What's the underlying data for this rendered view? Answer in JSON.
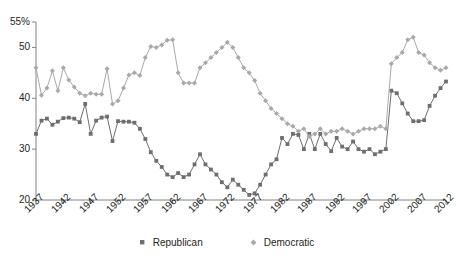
{
  "chart_data": {
    "type": "line",
    "title": "",
    "subtitle": "",
    "xlabel": "",
    "ylabel": "",
    "xlim": [
      1937,
      2012
    ],
    "ylim": [
      20,
      55
    ],
    "grid": false,
    "legend_position": "bottom-center",
    "y_ticks": [
      20,
      30,
      40,
      50,
      55
    ],
    "y_tick_labels": [
      "20",
      "30",
      "40",
      "50",
      "55%"
    ],
    "x_ticks": [
      1937,
      1942,
      1947,
      1952,
      1957,
      1962,
      1967,
      1972,
      1977,
      1982,
      1987,
      1992,
      1997,
      2002,
      2007,
      2012
    ],
    "x_tick_labels": [
      "1937",
      "1942",
      "1947",
      "1952",
      "1957",
      "1962",
      "1967",
      "1972",
      "1977",
      "1982",
      "1987",
      "1992",
      "1997",
      "2002",
      "2007",
      "2012"
    ],
    "x": [
      1937,
      1938,
      1939,
      1940,
      1941,
      1942,
      1943,
      1944,
      1945,
      1946,
      1947,
      1948,
      1949,
      1950,
      1951,
      1952,
      1953,
      1954,
      1955,
      1956,
      1957,
      1958,
      1959,
      1960,
      1961,
      1962,
      1963,
      1964,
      1965,
      1966,
      1967,
      1968,
      1969,
      1970,
      1971,
      1972,
      1973,
      1974,
      1975,
      1976,
      1977,
      1978,
      1979,
      1980,
      1981,
      1982,
      1983,
      1984,
      1985,
      1986,
      1987,
      1988,
      1989,
      1990,
      1991,
      1992,
      1993,
      1994,
      1995,
      1996,
      1997,
      1998,
      1999,
      2000,
      2001,
      2002,
      2003,
      2004,
      2005,
      2006,
      2007,
      2008,
      2009,
      2010,
      2011,
      2012
    ],
    "series": [
      {
        "name": "Republican",
        "color": "#6d6e71",
        "marker": "square",
        "values": [
          33.0,
          35.6,
          36.0,
          34.8,
          35.4,
          36.1,
          36.2,
          36.0,
          35.3,
          38.9,
          33.0,
          35.6,
          36.2,
          36.4,
          31.6,
          35.5,
          35.4,
          35.4,
          35.2,
          34.0,
          32.0,
          29.4,
          27.7,
          26.5,
          25.0,
          24.5,
          25.3,
          24.5,
          25.0,
          27.0,
          29.0,
          27.0,
          26.0,
          25.0,
          23.5,
          22.5,
          24.0,
          23.0,
          22.0,
          21.0,
          21.3,
          23.0,
          25.0,
          27.0,
          28.0,
          32.2,
          31.0,
          33.0,
          32.8,
          30.0,
          33.0,
          30.0,
          33.0,
          31.0,
          29.6,
          32.2,
          30.5,
          30.0,
          31.5,
          30.0,
          29.5,
          30.0,
          29.0,
          29.5,
          30.0,
          41.5,
          41.0,
          39.0,
          37.0,
          35.5,
          35.5,
          35.7,
          38.5,
          40.5,
          42.0,
          43.3
        ]
      },
      {
        "name": "Democratic",
        "color": "#a7a9ac",
        "marker": "diamond",
        "values": [
          46.0,
          40.6,
          42.0,
          45.4,
          41.5,
          46.0,
          43.6,
          42.2,
          41.0,
          40.5,
          41.0,
          40.8,
          40.8,
          45.8,
          38.9,
          39.5,
          42.0,
          44.6,
          45.0,
          44.5,
          48.0,
          50.2,
          50.0,
          50.5,
          51.4,
          51.5,
          45.0,
          43.0,
          43.0,
          43.0,
          46.0,
          47.0,
          48.0,
          49.0,
          50.0,
          51.0,
          50.0,
          48.0,
          46.0,
          45.0,
          43.5,
          41.0,
          39.5,
          38.0,
          37.0,
          36.0,
          35.0,
          34.5,
          33.5,
          34.0,
          32.5,
          33.0,
          34.0,
          33.0,
          33.5,
          33.5,
          34.0,
          33.5,
          33.0,
          33.5,
          34.0,
          34.0,
          34.0,
          34.5,
          34.0,
          46.8,
          48.0,
          49.0,
          51.5,
          52.0,
          49.0,
          48.5,
          47.0,
          46.0,
          45.5,
          46.0
        ]
      }
    ]
  },
  "legend": {
    "items": [
      {
        "label": "Republican",
        "color": "#6d6e71"
      },
      {
        "label": "Democratic",
        "color": "#a7a9ac"
      }
    ]
  },
  "axis": {
    "color": "#808285"
  }
}
